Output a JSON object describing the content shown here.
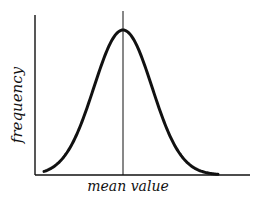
{
  "chart_data": {
    "type": "line",
    "title": "",
    "xlabel": "mean value",
    "ylabel": "frequency",
    "grid": false,
    "legend": null,
    "series": [
      {
        "name": "frequency distribution",
        "x": [
          -3.0,
          -2.5,
          -2.0,
          -1.5,
          -1.0,
          -0.5,
          0.0,
          0.5,
          1.0,
          1.5,
          2.0,
          2.5,
          3.0
        ],
        "values": [
          0.01,
          0.04,
          0.14,
          0.32,
          0.61,
          0.88,
          1.0,
          0.88,
          0.61,
          0.32,
          0.14,
          0.04,
          0.01
        ]
      }
    ],
    "annotations": [
      {
        "type": "vline",
        "x": 0.0,
        "label": "mean value"
      }
    ],
    "xlim": [
      -3.5,
      4.0
    ],
    "ylim": [
      0,
      1.1
    ]
  },
  "axes": {
    "x_label": "mean value",
    "y_label": "frequency"
  }
}
